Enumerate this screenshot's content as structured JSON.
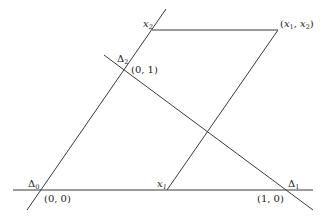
{
  "diagram": {
    "type": "geometric-construction",
    "lines": [
      {
        "id": "horizontal-axis",
        "x1": 13,
        "y1": 190,
        "x2": 313,
        "y2": 190
      },
      {
        "id": "delta0-line",
        "x1": 27,
        "y1": 210,
        "x2": 166,
        "y2": 9
      },
      {
        "id": "delta-line-through-0-1-and-1-0",
        "x1": 104,
        "y1": 55,
        "x2": 313,
        "y2": 210
      },
      {
        "id": "x2-horizontal",
        "x1": 152,
        "y1": 30,
        "x2": 278,
        "y2": 30
      },
      {
        "id": "x1-parallel",
        "x1": 167,
        "y1": 190,
        "x2": 278,
        "y2": 30
      }
    ],
    "labels": {
      "delta0": {
        "base": "Δ",
        "sub": "0"
      },
      "delta1": {
        "base": "Δ",
        "sub": "1"
      },
      "delta2": {
        "base": "Δ",
        "sub": "2"
      },
      "origin": "(0, 0)",
      "point_0_1": "(0, 1)",
      "point_1_0": "(1, 0)",
      "x1": {
        "base": "x",
        "sub": "1"
      },
      "x2": {
        "base": "x",
        "sub": "2"
      },
      "x1x2": {
        "open": "(",
        "a": "x",
        "a_sub": "1",
        "sep": ", ",
        "b": "x",
        "b_sub": "2",
        "close": ")"
      }
    }
  }
}
